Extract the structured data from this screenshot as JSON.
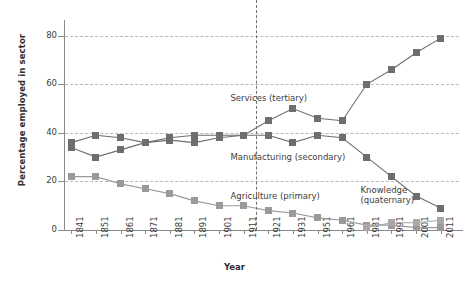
{
  "chart_data": {
    "type": "line",
    "title": "",
    "xlabel": "Year",
    "ylabel": "Percentage employed in sector",
    "ylim": [
      0,
      84
    ],
    "yticks": [
      0,
      20,
      40,
      60,
      80
    ],
    "ytick_labels": [
      "0",
      "20",
      "40",
      "60",
      "80"
    ],
    "grid": "horizontal-dashed",
    "gridlines": [
      20,
      40,
      60,
      80
    ],
    "legend_position": "inline-annotations",
    "categories": [
      "1841",
      "1851",
      "1861",
      "1871",
      "1881",
      "1891",
      "1901",
      "1911",
      "1921",
      "1931",
      "1951",
      "1961",
      "1981",
      "1991",
      "2001",
      "2011"
    ],
    "vertical_divider_after": "1911",
    "series": [
      {
        "name": "Agriculture (primary)",
        "color": "#9a9a9a",
        "values": [
          22,
          22,
          19,
          17,
          15,
          12,
          10,
          10,
          8,
          7,
          5,
          4,
          2,
          2,
          1,
          1
        ]
      },
      {
        "name": "Manufacturing (secondary)",
        "color": "#6e6e6e",
        "values": [
          36,
          39,
          38,
          36,
          38,
          39,
          39,
          39,
          39,
          36,
          39,
          38,
          30,
          22,
          14,
          9
        ]
      },
      {
        "name": "Services (tertiary)",
        "color": "#6e6e6e",
        "values": [
          34,
          30,
          33,
          36,
          37,
          36,
          38,
          39,
          45,
          50,
          46,
          45,
          60,
          66,
          73,
          79
        ]
      },
      {
        "name": "Knowledge (quaternary)",
        "color": "#a8a8a8",
        "values": [
          null,
          null,
          null,
          null,
          null,
          null,
          null,
          null,
          null,
          null,
          null,
          null,
          1,
          3,
          3,
          4
        ]
      }
    ],
    "annotations": [
      {
        "name": "services-label",
        "text": "Services (tertiary)",
        "x_pct": 42,
        "y_pct": 33
      },
      {
        "name": "manufacturing-label",
        "text": "Manufacturing (secondary)",
        "x_pct": 42,
        "y_pct": 62
      },
      {
        "name": "agriculture-label",
        "text": "Agriculture (primary)",
        "x_pct": 42,
        "y_pct": 81
      },
      {
        "name": "knowledge-label",
        "text": "Knowledge\n(quaternary)",
        "x_pct": 75,
        "y_pct": 78
      }
    ]
  }
}
